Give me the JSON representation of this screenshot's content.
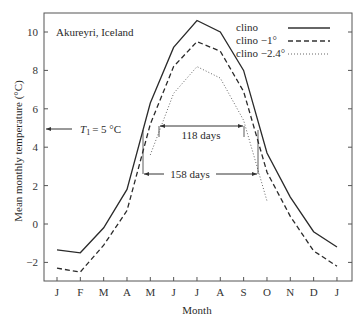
{
  "chart_data": {
    "type": "line",
    "title": "Akureyri, Iceland",
    "xlabel": "Month",
    "ylabel": "Mean monthly temperature (°C)",
    "categories": [
      "J",
      "F",
      "M",
      "A",
      "M",
      "J",
      "J",
      "A",
      "S",
      "O",
      "N",
      "D",
      "J"
    ],
    "yticks": [
      "10",
      "8",
      "6",
      "4",
      "2",
      "0",
      "−2"
    ],
    "ylim": [
      -3,
      11
    ],
    "grid": false,
    "legend_position": "upper right",
    "series": [
      {
        "name": "clino",
        "style": "solid",
        "values": [
          -1.35,
          -1.5,
          -0.2,
          1.8,
          6.3,
          9.2,
          10.6,
          10.0,
          8.0,
          3.7,
          1.4,
          -0.4,
          -1.2
        ]
      },
      {
        "name": "clino −1°",
        "style": "dashed",
        "values": [
          -2.3,
          -2.5,
          -1.1,
          0.7,
          5.2,
          8.2,
          9.5,
          9.0,
          6.9,
          2.7,
          0.4,
          -1.4,
          -2.2
        ]
      },
      {
        "name": "clino −2.4°",
        "style": "dotted",
        "values": [
          null,
          null,
          null,
          null,
          3.6,
          6.8,
          8.2,
          7.6,
          5.4,
          1.2,
          null,
          null,
          null
        ]
      }
    ],
    "annotations": [
      {
        "text": "T₁ = 5 °C",
        "type": "threshold",
        "value": 5
      },
      {
        "text": "118 days"
      },
      {
        "text": "158 days"
      }
    ]
  },
  "labels": {
    "title": "Akureyri, Iceland",
    "xlabel": "Month",
    "ylabel": "Mean monthly temperature (°C)",
    "threshold": "= 5 °C",
    "threshold_var": "T",
    "threshold_sub": "1",
    "span_short": "118 days",
    "span_long": "158 days",
    "legend": [
      "clino",
      "clino −1°",
      "clino −2.4°"
    ],
    "months": [
      "J",
      "F",
      "M",
      "A",
      "M",
      "J",
      "J",
      "A",
      "S",
      "O",
      "N",
      "D",
      "J"
    ],
    "yticks": [
      "10",
      "8",
      "6",
      "4",
      "2",
      "0",
      "−2"
    ]
  }
}
